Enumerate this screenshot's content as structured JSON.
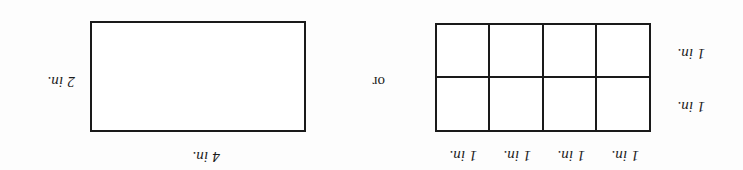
{
  "figure": {
    "orientation": "upside-down",
    "background_color": "#fdfdfd",
    "line_color": "#1a1a1a",
    "text_color": "#1b1b1b",
    "connector": "or",
    "grid_figure": {
      "columns": 4,
      "rows": 2,
      "top_labels": [
        "1 in.",
        "1 in.",
        "1 in.",
        "1 in."
      ],
      "left_labels": [
        "1 in.",
        "1 in."
      ],
      "cells": [
        [
          "",
          "",
          "",
          ""
        ],
        [
          "",
          "",
          "",
          ""
        ]
      ]
    },
    "rect_figure": {
      "top_label": "4 in.",
      "side_label": "2 in."
    }
  }
}
